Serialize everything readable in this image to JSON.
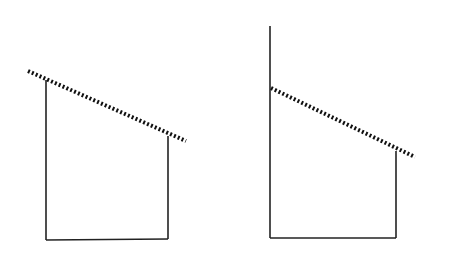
{
  "diagram": {
    "stroke_color": "#222222",
    "background": "#ffffff",
    "figures": [
      {
        "name": "left-figure",
        "walls": [
          {
            "x1": 46,
            "y1": 80,
            "x2": 46,
            "y2": 240
          },
          {
            "x1": 168,
            "y1": 136,
            "x2": 168,
            "y2": 239
          },
          {
            "x1": 46,
            "y1": 240,
            "x2": 168,
            "y2": 239
          }
        ],
        "slope": {
          "x1": 28,
          "y1": 71,
          "x2": 186,
          "y2": 141
        }
      },
      {
        "name": "right-figure",
        "walls": [
          {
            "x1": 270,
            "y1": 26,
            "x2": 270,
            "y2": 238
          },
          {
            "x1": 396,
            "y1": 151,
            "x2": 396,
            "y2": 238
          },
          {
            "x1": 270,
            "y1": 238,
            "x2": 396,
            "y2": 238
          }
        ],
        "slope": {
          "x1": 271,
          "y1": 88,
          "x2": 415,
          "y2": 157
        }
      }
    ]
  }
}
